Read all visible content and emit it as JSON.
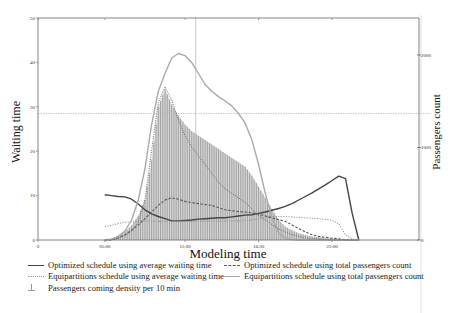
{
  "chart_data": {
    "type": "line",
    "title": "",
    "xlabel": "Modeling time",
    "ylabel": "Waiting time",
    "ylabel_right": "Passengers count",
    "x_ticks": [
      {
        "label": "0",
        "pos": 0
      },
      {
        "label": "05:00",
        "pos": 5
      },
      {
        "label": "11:00",
        "pos": 11
      },
      {
        "label": "16:30",
        "pos": 16.5
      },
      {
        "label": "22:00",
        "pos": 22
      }
    ],
    "xlim": [
      0,
      28.5
    ],
    "ylim": [
      0,
      50
    ],
    "y_ticks": [
      0,
      10,
      20,
      30,
      40,
      50
    ],
    "ylim_right": [
      0,
      2400
    ],
    "y_ticks_right": [
      0,
      1000,
      2000
    ],
    "reference_lines": {
      "vertical_x": 11.8,
      "horizontal_y": 28.5
    },
    "grid": false,
    "legend_position": "bottom",
    "x": [
      5,
      5.5,
      6,
      6.5,
      7,
      7.5,
      8,
      8.5,
      9,
      9.5,
      10,
      10.5,
      11,
      11.5,
      12,
      12.5,
      13,
      13.5,
      14,
      14.5,
      15,
      15.5,
      16,
      16.5,
      17,
      17.5,
      18,
      18.5,
      19,
      19.5,
      20,
      20.5,
      21,
      21.5,
      22,
      22.5,
      23,
      23.5,
      24
    ],
    "series": [
      {
        "name": "Optimized schedule using average waiting time",
        "style": "solid-dark",
        "axis": "left",
        "values": [
          10.2,
          10.0,
          9.8,
          9.7,
          9.2,
          8.1,
          6.8,
          5.9,
          5.3,
          4.8,
          4.3,
          4.3,
          4.4,
          4.5,
          4.7,
          4.8,
          4.9,
          5.0,
          5.0,
          5.2,
          5.4,
          5.6,
          5.7,
          6.0,
          6.3,
          6.7,
          7.1,
          7.6,
          8.2,
          9.0,
          9.8,
          10.6,
          11.5,
          12.4,
          13.4,
          14.4,
          13.8,
          6.0,
          0.0
        ]
      },
      {
        "name": "Equipartitions schedule using average waiting time",
        "style": "dotted",
        "axis": "left",
        "values": [
          3.0,
          3.3,
          3.7,
          4.0,
          4.1,
          4.2,
          4.3,
          4.3,
          4.2,
          4.2,
          4.2,
          4.2,
          4.2,
          4.2,
          4.2,
          4.2,
          4.2,
          4.2,
          4.3,
          4.3,
          4.3,
          4.4,
          4.5,
          4.8,
          5.0,
          5.3,
          5.3,
          5.3,
          5.2,
          5.1,
          5.0,
          4.9,
          4.8,
          4.6,
          4.5,
          3.6,
          1.2,
          0.2,
          0.0
        ]
      },
      {
        "name": "Optimized schedule using total passengers count",
        "style": "dashed",
        "axis": "left",
        "values": [
          0.0,
          0.0,
          0.5,
          1.2,
          2.2,
          3.4,
          4.8,
          6.3,
          7.8,
          9.0,
          9.5,
          9.2,
          8.7,
          8.4,
          8.2,
          8.0,
          7.8,
          7.3,
          6.8,
          6.6,
          6.4,
          6.3,
          6.1,
          5.8,
          5.4,
          5.0,
          4.6,
          4.2,
          3.4,
          2.6,
          1.8,
          1.2,
          0.8,
          0.6,
          0.4,
          0.3,
          0.1,
          0.0,
          0.0
        ]
      },
      {
        "name": "Equipartitions schedule using total passengers count",
        "style": "solid-light",
        "axis": "left",
        "values": [
          0.0,
          0.2,
          0.8,
          2.0,
          4.5,
          9.0,
          16.0,
          26.0,
          33.5,
          37.5,
          41.0,
          42.0,
          41.5,
          40.0,
          37.5,
          35.0,
          33.5,
          32.3,
          31.3,
          30.2,
          28.5,
          26.3,
          22.5,
          17.0,
          10.5,
          5.0,
          1.6,
          0.4,
          0.1,
          0.0,
          0.0,
          0.0,
          0.0,
          0.0,
          0.0,
          0.0,
          0.0,
          0.0,
          0.0
        ]
      },
      {
        "name": "Optimized schedule using average waiting time (peak envelope, dotted)",
        "style": "dotted-dark",
        "axis": "left",
        "values": [
          0.0,
          0.0,
          0.4,
          1.0,
          2.0,
          4.0,
          9.0,
          20.0,
          31.0,
          34.5,
          31.5,
          27.0,
          23.5,
          21.0,
          19.0,
          17.0,
          15.0,
          13.0,
          11.5,
          10.5,
          9.5,
          8.5,
          7.0,
          5.5,
          4.5,
          3.5,
          2.5,
          1.8,
          1.2,
          0.8,
          0.5,
          0.3,
          0.2,
          0.1,
          0.0,
          0.0,
          0.0,
          0.0,
          0.0
        ]
      },
      {
        "name": "Passengers coming density per 10 min",
        "style": "bars",
        "axis": "left",
        "values": [
          0.0,
          0.3,
          0.9,
          1.8,
          3.3,
          5.5,
          9.0,
          18.0,
          30.0,
          34.0,
          30.5,
          28.0,
          26.0,
          24.5,
          23.5,
          22.5,
          21.5,
          20.5,
          19.5,
          18.5,
          17.5,
          16.5,
          14.5,
          12.0,
          9.5,
          7.0,
          4.5,
          3.0,
          2.2,
          1.5,
          1.1,
          0.8,
          0.6,
          0.4,
          0.3,
          0.2,
          0.1,
          0.0,
          0.0
        ]
      }
    ]
  },
  "legend": {
    "items": [
      {
        "label": "Optimized schedule using average waiting time",
        "swatch": "solid-dark"
      },
      {
        "label": "Optimized schedule using total passengers count",
        "swatch": "dashed"
      },
      {
        "label": "Equipartitions schedule using average waiting time",
        "swatch": "dotted"
      },
      {
        "label": "Equipartitions schedule using total passengers count",
        "swatch": "solid-light"
      },
      {
        "label": "Passengers coming density per 10 min",
        "swatch": "bar"
      }
    ]
  }
}
